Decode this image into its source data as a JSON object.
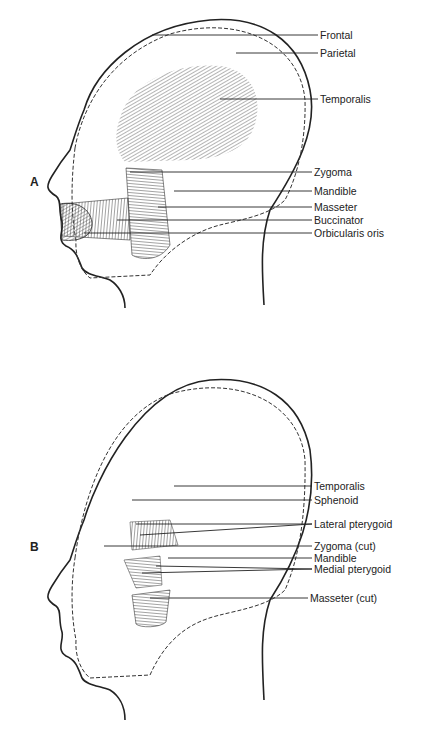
{
  "figure": {
    "panel_a": {
      "letter": "A",
      "labels": [
        "Frontal",
        "Parietal",
        "Temporalis",
        "Zygoma",
        "Mandible",
        "Masseter",
        "Buccinator",
        "Orbicularis oris"
      ]
    },
    "panel_b": {
      "letter": "B",
      "labels": [
        "Temporalis",
        "Sphenoid",
        "Lateral pterygoid",
        "Zygoma (cut)",
        "Mandible",
        "Medial pterygoid",
        "Masseter (cut)"
      ]
    }
  }
}
